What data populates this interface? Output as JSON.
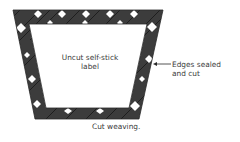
{
  "diagram": {
    "center_label": "Uncut self-stick label",
    "center_label_lines": [
      "Uncut self-stick",
      "label"
    ],
    "edge_annotation_lines": [
      "Edges sealed",
      "and cut"
    ],
    "caption": "Cut weaving.",
    "colors": {
      "weave_dark": "#3c3c3c",
      "weave_line": "#1e1e1e",
      "gap_white": "#ffffff",
      "label_fill": "#ffffff",
      "text": "#3a3a3a"
    }
  }
}
